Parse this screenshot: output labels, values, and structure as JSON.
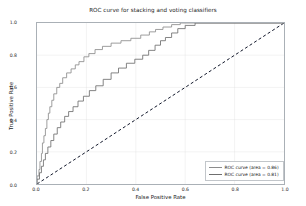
{
  "chart_data": {
    "type": "line",
    "title": "ROC curve for stacking and voting classifiers",
    "xlabel": "False Positive Rate",
    "ylabel": "True Positive Rate",
    "xlim": [
      0.0,
      1.0
    ],
    "ylim": [
      0.0,
      1.0
    ],
    "xticks": [
      "0.0",
      "0.2",
      "0.4",
      "0.6",
      "0.8",
      "1.0"
    ],
    "xtick_values": [
      0.0,
      0.2,
      0.4,
      0.6,
      0.8,
      1.0
    ],
    "yticks": [
      "0.0",
      "0.2",
      "0.4",
      "0.6",
      "0.8",
      "1.0"
    ],
    "ytick_values": [
      0.0,
      0.2,
      0.4,
      0.6,
      0.8,
      1.0
    ],
    "grid": true,
    "legend_position": "lower right",
    "series": [
      {
        "name": "ROC curve (area = 0.86)",
        "area": 0.86,
        "color": "#8c8c8c",
        "style": "step",
        "points": [
          [
            0.0,
            0.0
          ],
          [
            0.0,
            0.05
          ],
          [
            0.008,
            0.05
          ],
          [
            0.008,
            0.09
          ],
          [
            0.012,
            0.09
          ],
          [
            0.012,
            0.14
          ],
          [
            0.018,
            0.14
          ],
          [
            0.018,
            0.19
          ],
          [
            0.022,
            0.19
          ],
          [
            0.022,
            0.255
          ],
          [
            0.028,
            0.255
          ],
          [
            0.028,
            0.3
          ],
          [
            0.034,
            0.3
          ],
          [
            0.034,
            0.345
          ],
          [
            0.04,
            0.345
          ],
          [
            0.04,
            0.4
          ],
          [
            0.046,
            0.4
          ],
          [
            0.046,
            0.44
          ],
          [
            0.052,
            0.44
          ],
          [
            0.052,
            0.48
          ],
          [
            0.06,
            0.48
          ],
          [
            0.06,
            0.52
          ],
          [
            0.068,
            0.52
          ],
          [
            0.068,
            0.56
          ],
          [
            0.08,
            0.56
          ],
          [
            0.08,
            0.6
          ],
          [
            0.092,
            0.6
          ],
          [
            0.092,
            0.625
          ],
          [
            0.104,
            0.625
          ],
          [
            0.104,
            0.66
          ],
          [
            0.12,
            0.66
          ],
          [
            0.12,
            0.69
          ],
          [
            0.138,
            0.69
          ],
          [
            0.138,
            0.715
          ],
          [
            0.155,
            0.715
          ],
          [
            0.155,
            0.74
          ],
          [
            0.17,
            0.74
          ],
          [
            0.17,
            0.76
          ],
          [
            0.19,
            0.76
          ],
          [
            0.19,
            0.79
          ],
          [
            0.21,
            0.79
          ],
          [
            0.21,
            0.81
          ],
          [
            0.235,
            0.81
          ],
          [
            0.235,
            0.835
          ],
          [
            0.265,
            0.835
          ],
          [
            0.265,
            0.855
          ],
          [
            0.3,
            0.855
          ],
          [
            0.3,
            0.875
          ],
          [
            0.34,
            0.875
          ],
          [
            0.34,
            0.89
          ],
          [
            0.38,
            0.89
          ],
          [
            0.38,
            0.905
          ],
          [
            0.42,
            0.905
          ],
          [
            0.42,
            0.925
          ],
          [
            0.455,
            0.925
          ],
          [
            0.455,
            0.945
          ],
          [
            0.48,
            0.945
          ],
          [
            0.48,
            0.96
          ],
          [
            0.51,
            0.96
          ],
          [
            0.51,
            0.975
          ],
          [
            0.545,
            0.975
          ],
          [
            0.545,
            0.99
          ],
          [
            0.58,
            0.99
          ],
          [
            0.58,
            1.0
          ],
          [
            1.0,
            1.0
          ]
        ]
      },
      {
        "name": "ROC curve (area = 0.81)",
        "area": 0.81,
        "color": "#6f6f6f",
        "style": "step",
        "points": [
          [
            0.0,
            0.0
          ],
          [
            0.0,
            0.03
          ],
          [
            0.01,
            0.03
          ],
          [
            0.01,
            0.07
          ],
          [
            0.018,
            0.07
          ],
          [
            0.018,
            0.11
          ],
          [
            0.026,
            0.11
          ],
          [
            0.026,
            0.15
          ],
          [
            0.034,
            0.15
          ],
          [
            0.034,
            0.19
          ],
          [
            0.044,
            0.19
          ],
          [
            0.044,
            0.23
          ],
          [
            0.056,
            0.23
          ],
          [
            0.056,
            0.27
          ],
          [
            0.068,
            0.27
          ],
          [
            0.068,
            0.31
          ],
          [
            0.082,
            0.31
          ],
          [
            0.082,
            0.35
          ],
          [
            0.096,
            0.35
          ],
          [
            0.096,
            0.385
          ],
          [
            0.112,
            0.385
          ],
          [
            0.112,
            0.42
          ],
          [
            0.128,
            0.42
          ],
          [
            0.128,
            0.45
          ],
          [
            0.146,
            0.45
          ],
          [
            0.146,
            0.48
          ],
          [
            0.166,
            0.48
          ],
          [
            0.166,
            0.515
          ],
          [
            0.188,
            0.515
          ],
          [
            0.188,
            0.545
          ],
          [
            0.212,
            0.545
          ],
          [
            0.212,
            0.58
          ],
          [
            0.238,
            0.58
          ],
          [
            0.238,
            0.61
          ],
          [
            0.268,
            0.61
          ],
          [
            0.268,
            0.65
          ],
          [
            0.3,
            0.65
          ],
          [
            0.3,
            0.69
          ],
          [
            0.33,
            0.69
          ],
          [
            0.33,
            0.72
          ],
          [
            0.362,
            0.72
          ],
          [
            0.362,
            0.75
          ],
          [
            0.396,
            0.75
          ],
          [
            0.396,
            0.775
          ],
          [
            0.428,
            0.775
          ],
          [
            0.428,
            0.8
          ],
          [
            0.452,
            0.8
          ],
          [
            0.452,
            0.83
          ],
          [
            0.478,
            0.83
          ],
          [
            0.478,
            0.862
          ],
          [
            0.5,
            0.862
          ],
          [
            0.5,
            0.89
          ],
          [
            0.52,
            0.89
          ],
          [
            0.52,
            0.91
          ],
          [
            0.545,
            0.91
          ],
          [
            0.545,
            0.938
          ],
          [
            0.57,
            0.938
          ],
          [
            0.57,
            0.965
          ],
          [
            0.6,
            0.965
          ],
          [
            0.6,
            0.985
          ],
          [
            0.64,
            0.985
          ],
          [
            0.64,
            1.0
          ],
          [
            1.0,
            1.0
          ]
        ]
      }
    ],
    "reference_line": {
      "name": "chance-diagonal",
      "style": "dashed",
      "color": "#12182b",
      "points": [
        [
          0.0,
          0.0
        ],
        [
          1.0,
          1.0
        ]
      ]
    },
    "colors": {
      "grid": "#dcdcdc",
      "axis": "#aab0b6",
      "text": "#1a1a1a"
    }
  }
}
